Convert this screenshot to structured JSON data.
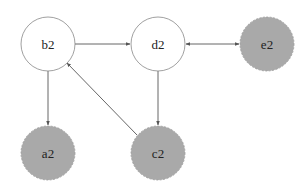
{
  "diagram": {
    "type": "directed-graph",
    "colors": {
      "background": "#ffffff",
      "edge": "#555555",
      "white_node_fill": "#ffffff",
      "white_node_stroke": "#888888",
      "gray_node_fill": "#a9a9a9",
      "gray_node_stroke": "#999999",
      "label": "#222222"
    },
    "nodes": [
      {
        "id": "b2",
        "label": "b2",
        "cx": 48,
        "cy": 44,
        "r": 27,
        "style": "white"
      },
      {
        "id": "d2",
        "label": "d2",
        "cx": 158,
        "cy": 44,
        "r": 27,
        "style": "white"
      },
      {
        "id": "e2",
        "label": "e2",
        "cx": 267,
        "cy": 44,
        "r": 27,
        "style": "gray"
      },
      {
        "id": "a2",
        "label": "a2",
        "cx": 48,
        "cy": 153,
        "r": 27,
        "style": "gray"
      },
      {
        "id": "c2",
        "label": "c2",
        "cx": 158,
        "cy": 153,
        "r": 27,
        "style": "gray"
      }
    ],
    "edges": [
      {
        "from": "b2",
        "to": "d2",
        "bidirectional": false
      },
      {
        "from": "d2",
        "to": "e2",
        "bidirectional": true
      },
      {
        "from": "b2",
        "to": "a2",
        "bidirectional": false
      },
      {
        "from": "d2",
        "to": "c2",
        "bidirectional": false
      },
      {
        "from": "c2",
        "to": "b2",
        "bidirectional": false
      }
    ]
  }
}
